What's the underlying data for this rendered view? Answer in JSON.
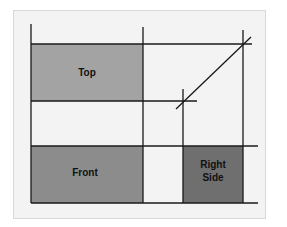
{
  "diagram": {
    "views": [
      {
        "id": "top",
        "label_lines": [
          "Top"
        ],
        "fill": "#a3a3a3"
      },
      {
        "id": "front",
        "label_lines": [
          "Front"
        ],
        "fill": "#8c8c8c"
      },
      {
        "id": "right-side",
        "label_lines": [
          "Right",
          "Side"
        ],
        "fill": "#6f6f6f"
      }
    ],
    "colors": {
      "panel": "#f3f3f3",
      "line": "#1a1a1a"
    }
  }
}
